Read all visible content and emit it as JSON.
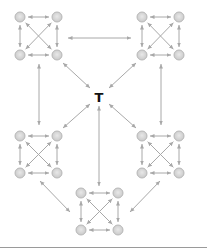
{
  "diagram": {
    "title": "",
    "center": {
      "label": "T",
      "x": 99,
      "y": 97
    },
    "colors": {
      "node_fill": "#d4d4d4",
      "node_stroke": "#b8b8b8",
      "node_inner": "#e6e6e6",
      "edge": "#a8a8a8",
      "label": "#111111",
      "rule": "#9a9a9a"
    },
    "clusters": [
      {
        "id": "top-left",
        "nodes": [
          [
            20,
            17
          ],
          [
            57,
            17
          ],
          [
            20,
            55
          ],
          [
            57,
            55
          ]
        ]
      },
      {
        "id": "top-right",
        "nodes": [
          [
            142,
            17
          ],
          [
            179,
            17
          ],
          [
            142,
            55
          ],
          [
            179,
            55
          ]
        ]
      },
      {
        "id": "middle-left",
        "nodes": [
          [
            20,
            136
          ],
          [
            57,
            136
          ],
          [
            20,
            173
          ],
          [
            57,
            173
          ]
        ]
      },
      {
        "id": "middle-right",
        "nodes": [
          [
            142,
            136
          ],
          [
            179,
            136
          ],
          [
            142,
            173
          ],
          [
            179,
            173
          ]
        ]
      },
      {
        "id": "bottom",
        "nodes": [
          [
            81,
            193
          ],
          [
            118,
            193
          ],
          [
            81,
            230
          ],
          [
            118,
            230
          ]
        ]
      }
    ],
    "inter_edges": [
      {
        "from": "top-left",
        "to": "top-right",
        "x1": 68,
        "y1": 38,
        "x2": 131,
        "y2": 38
      },
      {
        "from": "top-left",
        "to": "middle-left",
        "x1": 39,
        "y1": 64,
        "x2": 39,
        "y2": 125
      },
      {
        "from": "top-right",
        "to": "middle-right",
        "x1": 161,
        "y1": 64,
        "x2": 161,
        "y2": 125
      },
      {
        "from": "top-left",
        "to": "T",
        "x1": 63,
        "y1": 63,
        "x2": 90,
        "y2": 88
      },
      {
        "from": "top-right",
        "to": "T",
        "x1": 136,
        "y1": 63,
        "x2": 109,
        "y2": 88
      },
      {
        "from": "middle-left",
        "to": "T",
        "x1": 63,
        "y1": 128,
        "x2": 90,
        "y2": 104
      },
      {
        "from": "middle-right",
        "to": "T",
        "x1": 136,
        "y1": 128,
        "x2": 109,
        "y2": 104
      },
      {
        "from": "bottom",
        "to": "T",
        "x1": 99,
        "y1": 186,
        "x2": 99,
        "y2": 106
      },
      {
        "from": "middle-left",
        "to": "bottom",
        "x1": 40,
        "y1": 181,
        "x2": 70,
        "y2": 212
      },
      {
        "from": "middle-right",
        "to": "bottom",
        "x1": 160,
        "y1": 181,
        "x2": 130,
        "y2": 212
      }
    ]
  }
}
